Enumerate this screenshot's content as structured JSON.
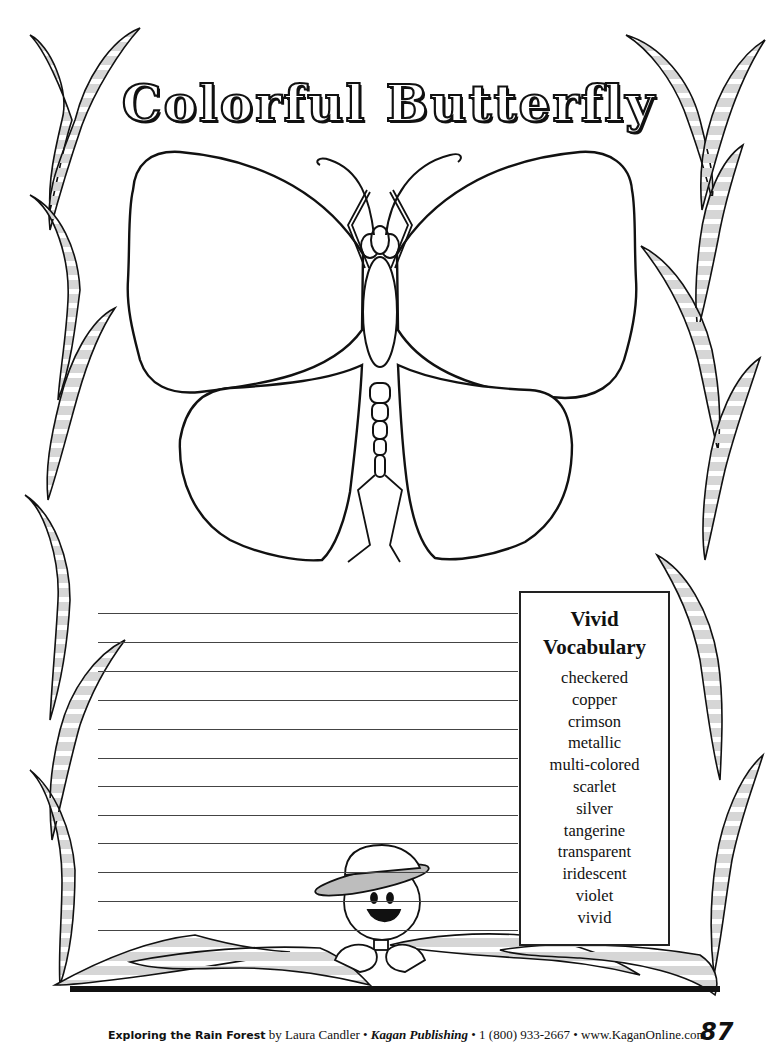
{
  "title": "Colorful Butterfly",
  "writing_area": {
    "line_count": 12,
    "line_positions_y": [
      613,
      642,
      671,
      700,
      729,
      758,
      786,
      815,
      843,
      872,
      901,
      930
    ]
  },
  "vocabulary_box": {
    "heading_line1": "Vivid",
    "heading_line2": "Vocabulary",
    "words": [
      "checkered",
      "copper",
      "crimson",
      "metallic",
      "multi-colored",
      "scarlet",
      "silver",
      "tangerine",
      "transparent",
      "iridescent",
      "violet",
      "vivid"
    ]
  },
  "footer": {
    "book_title": "Exploring the Rain Forest",
    "author": " by Laura Candler • ",
    "publisher": "Kagan Publishing",
    "contact": " • 1 (800) 933-2667 • www.KaganOnline.com",
    "page_number": "87"
  },
  "colors": {
    "ink": "#111111",
    "leaf_fill": "#d9d9d9",
    "paper": "#ffffff"
  }
}
